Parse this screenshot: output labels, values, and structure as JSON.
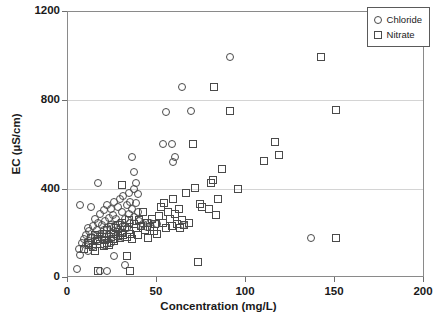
{
  "chart_data": {
    "type": "scatter",
    "title": "",
    "xlabel": "Concentration (mg/L)",
    "ylabel": "EC (µS/cm)",
    "xlim": [
      0,
      200
    ],
    "ylim": [
      0,
      1200
    ],
    "xticks": [
      0,
      50,
      100,
      150,
      200
    ],
    "yticks": [
      0,
      400,
      800,
      1200
    ],
    "xtick_labels": [
      "0",
      "50",
      "100",
      "150",
      "200"
    ],
    "ytick_labels": [
      "0",
      "400",
      "800",
      "1200"
    ],
    "grid": "horizontal",
    "legend_position": "top-right",
    "legend": [
      {
        "name": "Chloride",
        "marker": "circle"
      },
      {
        "name": "Nitrate",
        "marker": "square"
      }
    ],
    "series": [
      {
        "name": "Chloride",
        "marker": "circle",
        "points": [
          [
            5,
            40
          ],
          [
            6,
            130
          ],
          [
            7,
            105
          ],
          [
            7,
            330
          ],
          [
            8,
            160
          ],
          [
            9,
            175
          ],
          [
            10,
            150
          ],
          [
            10,
            195
          ],
          [
            11,
            120
          ],
          [
            11,
            225
          ],
          [
            12,
            165
          ],
          [
            12,
            210
          ],
          [
            13,
            320
          ],
          [
            13,
            180
          ],
          [
            14,
            145
          ],
          [
            14,
            235
          ],
          [
            15,
            190
          ],
          [
            15,
            265
          ],
          [
            16,
            170
          ],
          [
            16,
            215
          ],
          [
            17,
            430
          ],
          [
            17,
            250
          ],
          [
            18,
            30
          ],
          [
            18,
            200
          ],
          [
            18,
            290
          ],
          [
            19,
            175
          ],
          [
            19,
            240
          ],
          [
            20,
            150
          ],
          [
            20,
            305
          ],
          [
            20,
            215
          ],
          [
            21,
            185
          ],
          [
            21,
            255
          ],
          [
            22,
            30
          ],
          [
            22,
            225
          ],
          [
            22,
            330
          ],
          [
            23,
            195
          ],
          [
            23,
            270
          ],
          [
            24,
            160
          ],
          [
            24,
            240
          ],
          [
            24,
            310
          ],
          [
            25,
            205
          ],
          [
            25,
            285
          ],
          [
            26,
            100
          ],
          [
            26,
            230
          ],
          [
            26,
            345
          ],
          [
            27,
            190
          ],
          [
            27,
            265
          ],
          [
            28,
            215
          ],
          [
            28,
            320
          ],
          [
            29,
            180
          ],
          [
            29,
            250
          ],
          [
            29,
            355
          ],
          [
            30,
            205
          ],
          [
            30,
            300
          ],
          [
            31,
            235
          ],
          [
            31,
            370
          ],
          [
            32,
            60
          ],
          [
            32,
            265
          ],
          [
            33,
            225
          ],
          [
            33,
            330
          ],
          [
            34,
            290
          ],
          [
            34,
            385
          ],
          [
            35,
            250
          ],
          [
            35,
            345
          ],
          [
            36,
            310
          ],
          [
            36,
            545
          ],
          [
            37,
            275
          ],
          [
            37,
            400
          ],
          [
            37,
            480
          ],
          [
            38,
            340
          ],
          [
            38,
            430
          ],
          [
            39,
            300
          ],
          [
            39,
            380
          ],
          [
            40,
            255
          ],
          [
            41,
            235
          ],
          [
            42,
            245
          ],
          [
            44,
            230
          ],
          [
            46,
            250
          ],
          [
            50,
            245
          ],
          [
            53,
            605
          ],
          [
            55,
            750
          ],
          [
            58,
            605
          ],
          [
            59,
            525
          ],
          [
            60,
            545
          ],
          [
            64,
            860
          ],
          [
            65,
            240
          ],
          [
            69,
            755
          ],
          [
            91,
            995
          ],
          [
            136,
            180
          ]
        ]
      },
      {
        "name": "Nitrate",
        "marker": "square",
        "points": [
          [
            9,
            130
          ],
          [
            11,
            160
          ],
          [
            12,
            150
          ],
          [
            13,
            180
          ],
          [
            14,
            140
          ],
          [
            15,
            120
          ],
          [
            15,
            195
          ],
          [
            16,
            165
          ],
          [
            17,
            30
          ],
          [
            17,
            175
          ],
          [
            18,
            155
          ],
          [
            19,
            185
          ],
          [
            20,
            145
          ],
          [
            20,
            200
          ],
          [
            21,
            170
          ],
          [
            22,
            160
          ],
          [
            22,
            215
          ],
          [
            23,
            150
          ],
          [
            24,
            185
          ],
          [
            24,
            230
          ],
          [
            25,
            175
          ],
          [
            26,
            165
          ],
          [
            26,
            200
          ],
          [
            27,
            225
          ],
          [
            28,
            190
          ],
          [
            28,
            240
          ],
          [
            29,
            180
          ],
          [
            30,
            420
          ],
          [
            30,
            205
          ],
          [
            30,
            250
          ],
          [
            31,
            195
          ],
          [
            32,
            230
          ],
          [
            33,
            100
          ],
          [
            33,
            185
          ],
          [
            34,
            215
          ],
          [
            34,
            260
          ],
          [
            35,
            30
          ],
          [
            35,
            200
          ],
          [
            36,
            175
          ],
          [
            37,
            245
          ],
          [
            38,
            225
          ],
          [
            39,
            195
          ],
          [
            40,
            260
          ],
          [
            41,
            235
          ],
          [
            42,
            300
          ],
          [
            43,
            215
          ],
          [
            44,
            250
          ],
          [
            45,
            180
          ],
          [
            46,
            230
          ],
          [
            47,
            265
          ],
          [
            48,
            210
          ],
          [
            49,
            245
          ],
          [
            50,
            200
          ],
          [
            51,
            280
          ],
          [
            52,
            320
          ],
          [
            53,
            250
          ],
          [
            54,
            340
          ],
          [
            55,
            225
          ],
          [
            56,
            300
          ],
          [
            57,
            265
          ],
          [
            58,
            235
          ],
          [
            59,
            355
          ],
          [
            60,
            290
          ],
          [
            61,
            245
          ],
          [
            62,
            310
          ],
          [
            63,
            225
          ],
          [
            64,
            260
          ],
          [
            65,
            240
          ],
          [
            66,
            385
          ],
          [
            68,
            250
          ],
          [
            70,
            605
          ],
          [
            71,
            405
          ],
          [
            73,
            70
          ],
          [
            74,
            335
          ],
          [
            75,
            320
          ],
          [
            79,
            310
          ],
          [
            80,
            430
          ],
          [
            81,
            440
          ],
          [
            82,
            860
          ],
          [
            83,
            285
          ],
          [
            84,
            355
          ],
          [
            86,
            490
          ],
          [
            91,
            755
          ],
          [
            95,
            400
          ],
          [
            110,
            530
          ],
          [
            116,
            615
          ],
          [
            118,
            555
          ],
          [
            142,
            995
          ],
          [
            150,
            180
          ],
          [
            150,
            760
          ]
        ]
      }
    ]
  }
}
